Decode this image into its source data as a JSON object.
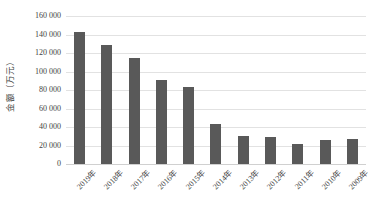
{
  "chart_data": {
    "type": "bar",
    "title": "",
    "subtitle": "",
    "xlabel": "",
    "ylabel": "金额（万元）",
    "ylim": [
      0,
      160000
    ],
    "ytick_step": 20000,
    "ytick_labels": [
      "160 000",
      "140 000",
      "120 000",
      "100 000",
      "80 000",
      "60 000",
      "40 000",
      "20 000",
      "0"
    ],
    "ytick_values": [
      160000,
      140000,
      120000,
      100000,
      80000,
      60000,
      40000,
      20000,
      0
    ],
    "grid": true,
    "legend": false,
    "legend_position": "none",
    "bar_color": "#595959",
    "gridline_color": "#e2e2e2",
    "background_color": "#ffffff",
    "categories": [
      "2019年",
      "2018年",
      "2017年",
      "2016年",
      "2015年",
      "2014年",
      "2013年",
      "2012年",
      "2011年",
      "2010年",
      "2009年"
    ],
    "values": [
      143000,
      129000,
      115000,
      91000,
      83000,
      43000,
      30000,
      29000,
      22000,
      26000,
      27000
    ],
    "series": [
      {
        "name": "金额",
        "values": [
          143000,
          129000,
          115000,
          91000,
          83000,
          43000,
          30000,
          29000,
          22000,
          26000,
          27000
        ]
      }
    ]
  }
}
